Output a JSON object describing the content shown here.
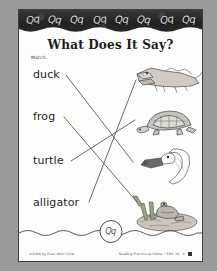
{
  "document": {
    "title": "What Does It Say?",
    "instruction": "Match.",
    "letter_focus": "Qq"
  },
  "header": {
    "band_letters": [
      "Qq",
      "Qq",
      "Qq",
      "Qq",
      "Qq",
      "Qq",
      "Qq",
      "Qq"
    ]
  },
  "activity": {
    "words": [
      {
        "label": "duck"
      },
      {
        "label": "frog"
      },
      {
        "label": "turtle"
      },
      {
        "label": "alligator"
      }
    ],
    "pictures": [
      {
        "name": "alligator-illustration",
        "alt": "alligator"
      },
      {
        "name": "turtle-illustration",
        "alt": "turtle"
      },
      {
        "name": "duck-illustration",
        "alt": "duck"
      },
      {
        "name": "frog-illustration",
        "alt": "frog"
      }
    ],
    "matches": [
      {
        "word": "duck",
        "picture": "duck"
      },
      {
        "word": "frog",
        "picture": "frog"
      },
      {
        "word": "turtle",
        "picture": "turtle"
      },
      {
        "word": "alligator",
        "picture": "alligator"
      }
    ]
  },
  "footer": {
    "badge_text": "Qq",
    "copyright": "©2008 by Evan-Moor Corp.",
    "source": "Reading Practice at Home • EMC 10 · A"
  },
  "colors": {
    "page": "#fdfdfb",
    "margin": "#9a9a9a",
    "band": "#2e2c2b",
    "ink": "#1f1f1f",
    "line": "#555555"
  }
}
